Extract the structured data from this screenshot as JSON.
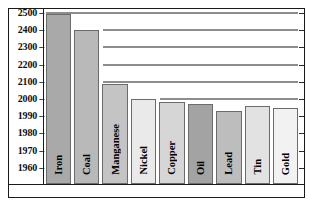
{
  "chart_data": {
    "type": "bar",
    "title": "",
    "subtitle": "",
    "xlabel": "",
    "ylabel": "",
    "grid": true,
    "legend": false,
    "orientation": "vertical",
    "axis_note": "broken y-axis: 2500-2000 in steps of 100, 2000-1960 in steps of 10",
    "ylim": [
      1955,
      2505
    ],
    "yticks": [
      2500,
      2400,
      2300,
      2200,
      2100,
      2000,
      1990,
      1980,
      1970,
      1960
    ],
    "ytick_labels": [
      "2500",
      "2400",
      "2300",
      "2200",
      "2100",
      "2000",
      "1990",
      "1980",
      "1970",
      "1960"
    ],
    "gridline_values": [
      2500,
      2400,
      2300,
      2200,
      2100,
      2000
    ],
    "categories": [
      "Iron",
      "Coal",
      "Manganese",
      "Nickel",
      "Copper",
      "Oil",
      "Lead",
      "Tin",
      "Gold"
    ],
    "values": [
      2495,
      2400,
      2090,
      2000,
      1998,
      1997,
      1993,
      1996,
      1995
    ],
    "bar_colors": [
      "#a9a9a9",
      "#b9b9b9",
      "#c4c4c4",
      "#eaeaea",
      "#d6d6d6",
      "#a3a3a3",
      "#bdbdbd",
      "#e2e2e2",
      "#f2f2f2"
    ]
  }
}
